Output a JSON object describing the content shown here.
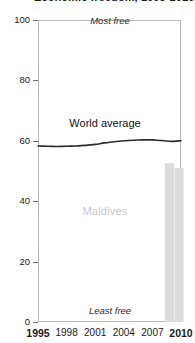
{
  "chart_data": {
    "type": "line",
    "title": "Economic freedom, 1995-2010",
    "xlabel": "",
    "ylabel": "",
    "xlim": [
      1995,
      2010
    ],
    "ylim": [
      0,
      100
    ],
    "grid": false,
    "legend_position": "inline-label",
    "x_ticks": [
      {
        "label": "1995",
        "value": 1995,
        "emphasis": true
      },
      {
        "label": "1998",
        "value": 1998,
        "emphasis": false
      },
      {
        "label": "2001",
        "value": 2001,
        "emphasis": false
      },
      {
        "label": "2004",
        "value": 2004,
        "emphasis": false
      },
      {
        "label": "2007",
        "value": 2007,
        "emphasis": false
      },
      {
        "label": "2010",
        "value": 2010,
        "emphasis": true
      }
    ],
    "y_ticks": [
      {
        "label": "100",
        "value": 100
      },
      {
        "label": "80",
        "value": 80
      },
      {
        "label": "60",
        "value": 60
      },
      {
        "label": "40",
        "value": 40
      },
      {
        "label": "20",
        "value": 20
      },
      {
        "label": "0",
        "value": 0
      }
    ],
    "annotations": [
      {
        "name": "most-free",
        "text": "Most free",
        "value": 100
      },
      {
        "name": "least-free",
        "text": "Least free",
        "value": 0
      },
      {
        "name": "country-watermark",
        "text": "Maldives",
        "value": 37
      }
    ],
    "series": [
      {
        "name": "World average",
        "label": "World average",
        "type": "line",
        "color": "#2b2b2b",
        "x": [
          1995,
          1996,
          1997,
          1998,
          1999,
          2000,
          2001,
          2002,
          2003,
          2004,
          2005,
          2006,
          2007,
          2008,
          2009,
          2010
        ],
        "values": [
          58.3,
          58.2,
          58.1,
          58.2,
          58.3,
          58.5,
          58.8,
          59.3,
          59.7,
          60.0,
          60.2,
          60.3,
          60.3,
          60.1,
          59.8,
          60.0
        ]
      },
      {
        "name": "Maldives",
        "label": "Maldives",
        "type": "bar",
        "color": "#dcdcdc",
        "x": [
          2009,
          2010
        ],
        "values": [
          52.6,
          51.0
        ]
      }
    ]
  }
}
